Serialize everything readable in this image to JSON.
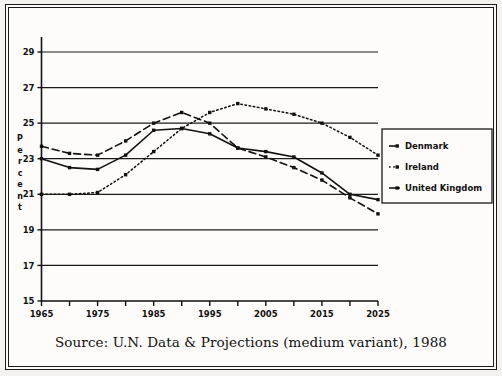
{
  "caption": "Source: U.N. Data & Projections (medium variant), 1988",
  "axis": {
    "ylabel": "Percent",
    "ylabel_chars": [
      "P",
      "e",
      "r",
      "c",
      "e",
      "n",
      "t"
    ],
    "ytick_labels": [
      "15",
      "17",
      "19",
      "21",
      "23",
      "25",
      "27",
      "29"
    ],
    "xtick_labels": [
      "1965",
      "1975",
      "1985",
      "1995",
      "2005",
      "2015",
      "2025"
    ]
  },
  "legend": {
    "items": [
      {
        "label": "Denmark",
        "style": "dashed",
        "color": "#111111"
      },
      {
        "label": "Ireland",
        "style": "dotted",
        "color": "#111111"
      },
      {
        "label": "United Kingdom",
        "style": "solid",
        "color": "#111111"
      }
    ]
  },
  "colors": {
    "frame": "#1a1a1a",
    "background": "#fdfcfa",
    "grid": "#1a1a1a",
    "axis": "#111111",
    "series": "#111111"
  },
  "chart_data": {
    "type": "line",
    "title": "",
    "subtitle": "",
    "xlabel": "",
    "ylabel": "Percent",
    "xlim": [
      1965,
      2025
    ],
    "ylim": [
      15,
      29
    ],
    "ytick_values": [
      15,
      17,
      19,
      21,
      23,
      25,
      27,
      29
    ],
    "xtick_values": [
      1965,
      1975,
      1985,
      1995,
      2005,
      2015,
      2025
    ],
    "xminor_tick_values": [
      1970,
      1980,
      1990,
      2000,
      2010,
      2020
    ],
    "grid": "horizontal",
    "legend_position": "right",
    "x": [
      1965,
      1970,
      1975,
      1980,
      1985,
      1990,
      1995,
      2000,
      2005,
      2010,
      2015,
      2020,
      2025
    ],
    "series": [
      {
        "name": "Denmark",
        "style": "dashed",
        "values": [
          23.7,
          23.3,
          23.2,
          24.0,
          25.0,
          25.6,
          25.0,
          23.6,
          23.1,
          22.5,
          21.8,
          20.8,
          19.9
        ]
      },
      {
        "name": "Ireland",
        "style": "dotted",
        "values": [
          21.0,
          21.0,
          21.1,
          22.1,
          23.4,
          24.7,
          25.6,
          26.1,
          25.8,
          25.5,
          25.0,
          24.2,
          23.2
        ]
      },
      {
        "name": "United Kingdom",
        "style": "solid",
        "values": [
          23.0,
          22.5,
          22.4,
          23.2,
          24.6,
          24.7,
          24.4,
          23.6,
          23.4,
          23.1,
          22.2,
          21.0,
          20.7
        ]
      }
    ]
  }
}
